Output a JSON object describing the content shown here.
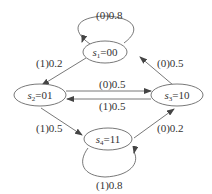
{
  "diagram": {
    "type": "state-transition",
    "nodes": [
      {
        "id": "s1",
        "name": "s",
        "sub": "1",
        "value": "=00"
      },
      {
        "id": "s2",
        "name": "s",
        "sub": "2",
        "value": "=01"
      },
      {
        "id": "s3",
        "name": "s",
        "sub": "3",
        "value": "=10"
      },
      {
        "id": "s4",
        "name": "s",
        "sub": "4",
        "value": "=11"
      }
    ],
    "edges": [
      {
        "from": "s1",
        "to": "s1",
        "label": "(0)0.8"
      },
      {
        "from": "s1",
        "to": "s2",
        "label": "(1)0.2"
      },
      {
        "from": "s3",
        "to": "s1",
        "label": "(0)0.5"
      },
      {
        "from": "s2",
        "to": "s3",
        "label": "(0)0.5"
      },
      {
        "from": "s3",
        "to": "s2",
        "label": "(1)0.5"
      },
      {
        "from": "s2",
        "to": "s4",
        "label": "(1)0.5"
      },
      {
        "from": "s4",
        "to": "s3",
        "label": "(0)0.2"
      },
      {
        "from": "s4",
        "to": "s4",
        "label": "(1)0.8"
      }
    ]
  }
}
